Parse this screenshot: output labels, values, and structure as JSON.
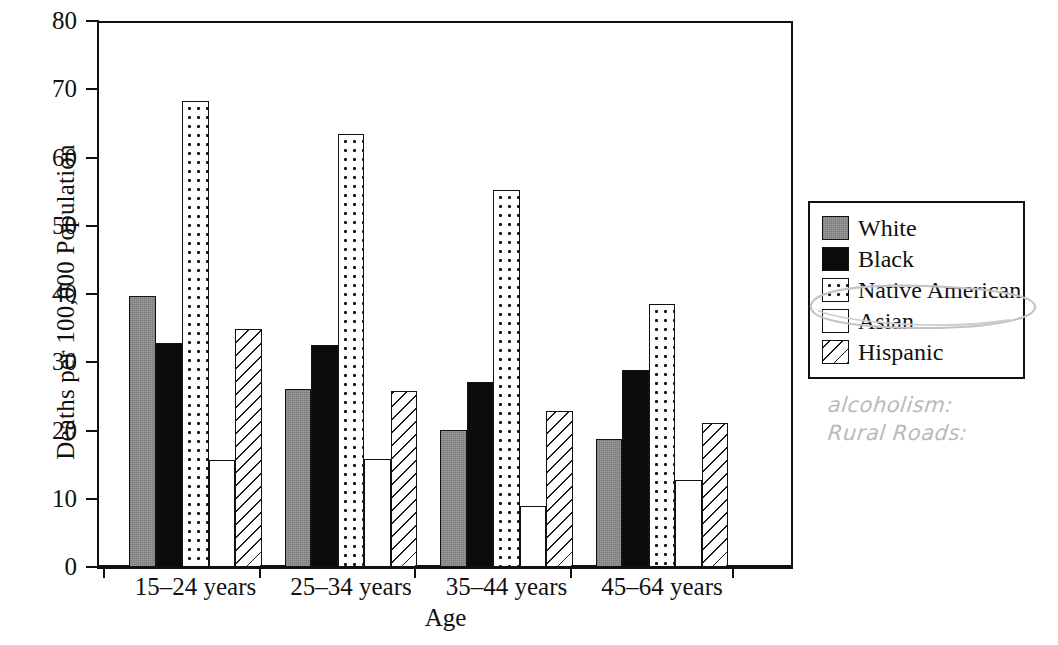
{
  "chart_data": {
    "type": "bar",
    "title": "",
    "xlabel": "Age",
    "ylabel": "Deaths per 100,000 Population",
    "ylim": [
      0,
      80
    ],
    "ytick_values": [
      0,
      10,
      20,
      30,
      40,
      50,
      60,
      70,
      80
    ],
    "ytick_labels": [
      "0",
      "10",
      "20",
      "30",
      "40",
      "50",
      "60",
      "70",
      "80"
    ],
    "grid": false,
    "legend_position": "right",
    "categories": [
      "15–24 years",
      "25–34 years",
      "35–44 years",
      "45–64 years"
    ],
    "series": [
      {
        "name": "White",
        "fill": "gray",
        "values": [
          39.7,
          26.1,
          20.1,
          18.7
        ]
      },
      {
        "name": "Black",
        "fill": "black",
        "values": [
          32.8,
          32.5,
          27.1,
          28.8
        ]
      },
      {
        "name": "Native American",
        "fill": "dots",
        "values": [
          68.3,
          63.4,
          55.2,
          38.5
        ]
      },
      {
        "name": "Asian",
        "fill": "white",
        "values": [
          15.7,
          15.8,
          9.0,
          12.7
        ]
      },
      {
        "name": "Hispanic",
        "fill": "hatch",
        "values": [
          34.9,
          25.8,
          22.9,
          21.1
        ]
      }
    ]
  },
  "legend": {
    "items": [
      {
        "label": "White",
        "fill": "gray"
      },
      {
        "label": "Black",
        "fill": "black"
      },
      {
        "label": "Native American",
        "fill": "dots"
      },
      {
        "label": "Asian",
        "fill": "white"
      },
      {
        "label": "Hispanic",
        "fill": "hatch"
      }
    ]
  },
  "annotations": {
    "pencil_notes": [
      "alcoholism:",
      "Rural Roads:"
    ],
    "circled_legend_item": "Native American"
  }
}
